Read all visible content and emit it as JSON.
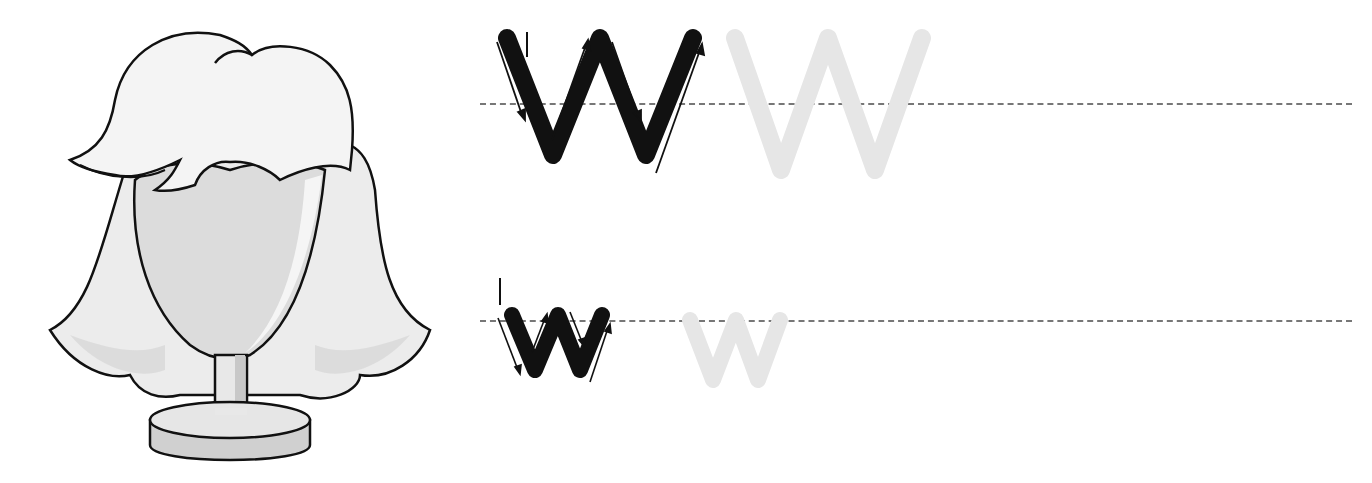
{
  "worksheet": {
    "letter": "W",
    "uppercase": {
      "label": "W",
      "model_color": "#111111",
      "trace_color": "#e6e6e6",
      "trace_count": 1
    },
    "lowercase": {
      "label": "w",
      "model_color": "#111111",
      "trace_color": "#e6e6e6",
      "trace_count": 1
    },
    "guideline_color": "#777777",
    "arrow_color": "#111111"
  },
  "illustration": {
    "subject": "wig on mannequin stand",
    "colors": {
      "outline": "#111111",
      "hair_fill": "#f4f4f4",
      "hair_shade": "#d6d6d6",
      "face_fill": "#dcdcdc",
      "stand_fill": "#e2e2e2"
    }
  }
}
